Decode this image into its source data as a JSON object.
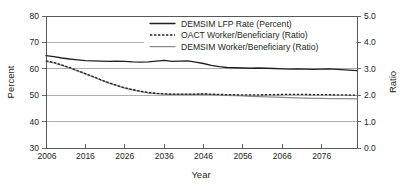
{
  "chart_data": {
    "type": "line",
    "title": "",
    "xlabel": "Year",
    "ylabel": "Percent",
    "y2label": "Ratio",
    "xlim": [
      2006,
      2085
    ],
    "ylim": [
      30,
      80
    ],
    "y2lim": [
      0.0,
      5.0
    ],
    "grid": true,
    "legend_position": "top-center",
    "xticks": [
      2006,
      2016,
      2026,
      2036,
      2046,
      2056,
      2066,
      2076
    ],
    "xtick_labels": [
      "2006",
      "2016",
      "2026",
      "2036",
      "2046",
      "2056",
      "2066",
      "2076"
    ],
    "yticks": [
      30,
      40,
      50,
      60,
      70,
      80
    ],
    "ytick_labels": [
      "30",
      "40",
      "50",
      "60",
      "70",
      "80"
    ],
    "y2ticks": [
      0.0,
      1.0,
      2.0,
      3.0,
      4.0,
      5.0
    ],
    "y2tick_labels": [
      "0.0",
      "1.0",
      "2.0",
      "3.0",
      "4.0",
      "5.0"
    ],
    "x": [
      2006,
      2008,
      2010,
      2012,
      2014,
      2016,
      2018,
      2020,
      2022,
      2024,
      2026,
      2028,
      2030,
      2032,
      2034,
      2036,
      2038,
      2040,
      2042,
      2044,
      2046,
      2048,
      2050,
      2052,
      2054,
      2056,
      2058,
      2060,
      2062,
      2064,
      2066,
      2068,
      2070,
      2072,
      2074,
      2076,
      2078,
      2080,
      2082,
      2085
    ],
    "series": [
      {
        "name": "DEMSIM LFP Rate (Percent)",
        "axis": "left",
        "units": "Percent",
        "style": "solid",
        "color": "#231f20",
        "values": [
          65.0,
          64.6,
          64.1,
          63.7,
          63.4,
          63.1,
          63.0,
          62.9,
          62.8,
          62.9,
          62.8,
          62.6,
          62.5,
          62.6,
          62.9,
          63.2,
          62.8,
          62.9,
          63.0,
          62.5,
          62.0,
          61.3,
          60.8,
          60.5,
          60.4,
          60.3,
          60.2,
          60.3,
          60.2,
          60.1,
          60.0,
          59.9,
          60.0,
          59.9,
          59.8,
          59.9,
          60.0,
          59.8,
          59.6,
          59.3
        ]
      },
      {
        "name": "OACT Worker/Beneficiary (Ratio)",
        "axis": "right",
        "units": "Ratio",
        "style": "dashed",
        "color": "#231f20",
        "values": [
          3.3,
          3.24,
          3.15,
          3.05,
          2.93,
          2.82,
          2.7,
          2.58,
          2.47,
          2.37,
          2.28,
          2.21,
          2.15,
          2.1,
          2.07,
          2.05,
          2.04,
          2.04,
          2.04,
          2.04,
          2.05,
          2.04,
          2.03,
          2.02,
          2.02,
          2.01,
          2.01,
          2.01,
          2.02,
          2.02,
          2.03,
          2.03,
          2.03,
          2.03,
          2.02,
          2.02,
          2.02,
          2.01,
          2.01,
          2.0
        ]
      },
      {
        "name": "DEMSIM Worker/Beneficiary (Ratio)",
        "axis": "right",
        "units": "Ratio",
        "style": "solid",
        "color": "#8d8d8d",
        "values": [
          3.28,
          3.22,
          3.13,
          3.03,
          2.92,
          2.81,
          2.69,
          2.57,
          2.46,
          2.36,
          2.27,
          2.2,
          2.14,
          2.09,
          2.06,
          2.04,
          2.03,
          2.03,
          2.03,
          2.03,
          2.04,
          2.02,
          2.0,
          1.99,
          1.98,
          1.97,
          1.96,
          1.95,
          1.94,
          1.93,
          1.92,
          1.91,
          1.9,
          1.89,
          1.88,
          1.88,
          1.87,
          1.87,
          1.87,
          1.86
        ]
      }
    ]
  },
  "axes": {
    "left_title": "Percent",
    "right_title": "Ratio",
    "bottom_title": "Year"
  },
  "legend": {
    "entries": [
      {
        "label": "DEMSIM LFP Rate (Percent)",
        "style": "solid-dark"
      },
      {
        "label": "OACT Worker/Beneficiary (Ratio)",
        "style": "dashed-dark"
      },
      {
        "label": "DEMSIM Worker/Beneficiary (Ratio)",
        "style": "solid-gray"
      }
    ]
  }
}
